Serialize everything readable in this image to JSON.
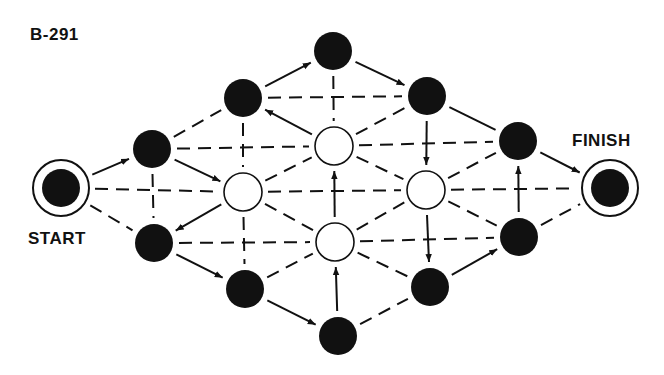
{
  "puzzle": {
    "id_label": "B-291",
    "start_label": "START",
    "finish_label": "FINISH"
  },
  "style": {
    "ink": "#111111",
    "background": "#ffffff",
    "node_radius": 19,
    "terminal_outer_radius": 28,
    "terminal_inner_radius": 19
  },
  "nodes": [
    {
      "id": "START",
      "x": 61,
      "y": 188,
      "type": "terminal"
    },
    {
      "id": "A1",
      "x": 152,
      "y": 149,
      "type": "black"
    },
    {
      "id": "A2",
      "x": 154,
      "y": 243,
      "type": "black"
    },
    {
      "id": "B1",
      "x": 243,
      "y": 98,
      "type": "black"
    },
    {
      "id": "W1",
      "x": 243,
      "y": 192,
      "type": "white"
    },
    {
      "id": "B2",
      "x": 245,
      "y": 289,
      "type": "black"
    },
    {
      "id": "T",
      "x": 333,
      "y": 51,
      "type": "black"
    },
    {
      "id": "W2",
      "x": 334,
      "y": 146,
      "type": "white"
    },
    {
      "id": "W3",
      "x": 335,
      "y": 242,
      "type": "white"
    },
    {
      "id": "Bo",
      "x": 338,
      "y": 336,
      "type": "black"
    },
    {
      "id": "C1",
      "x": 427,
      "y": 96,
      "type": "black"
    },
    {
      "id": "W4",
      "x": 426,
      "y": 190,
      "type": "white"
    },
    {
      "id": "C2",
      "x": 430,
      "y": 287,
      "type": "black"
    },
    {
      "id": "D1",
      "x": 518,
      "y": 141,
      "type": "black"
    },
    {
      "id": "D2",
      "x": 519,
      "y": 237,
      "type": "black"
    },
    {
      "id": "FINISH",
      "x": 610,
      "y": 188,
      "type": "terminal"
    }
  ],
  "edges": [
    {
      "from": "START",
      "to": "A1",
      "style": "arrow"
    },
    {
      "from": "START",
      "to": "W1",
      "style": "dashed"
    },
    {
      "from": "START",
      "to": "A2",
      "style": "dashed"
    },
    {
      "from": "A1",
      "to": "B1",
      "style": "dashed"
    },
    {
      "from": "A1",
      "to": "W2",
      "style": "dashed"
    },
    {
      "from": "A1",
      "to": "W1",
      "style": "arrow"
    },
    {
      "from": "A1",
      "to": "A2",
      "style": "dashed"
    },
    {
      "from": "W1",
      "to": "A2",
      "style": "arrow"
    },
    {
      "from": "A2",
      "to": "W3",
      "style": "dashed"
    },
    {
      "from": "A2",
      "to": "B2",
      "style": "arrow"
    },
    {
      "from": "B1",
      "to": "T",
      "style": "arrow"
    },
    {
      "from": "B1",
      "to": "C1",
      "style": "dashed"
    },
    {
      "from": "B1",
      "to": "W1",
      "style": "dashed"
    },
    {
      "from": "W2",
      "to": "B1",
      "style": "arrow"
    },
    {
      "from": "W1",
      "to": "W2",
      "style": "dashed"
    },
    {
      "from": "W1",
      "to": "W4",
      "style": "dashed"
    },
    {
      "from": "W1",
      "to": "W3",
      "style": "dashed"
    },
    {
      "from": "W1",
      "to": "B2",
      "style": "dashed"
    },
    {
      "from": "B2",
      "to": "W3",
      "style": "dashed"
    },
    {
      "from": "B2",
      "to": "Bo",
      "style": "arrow"
    },
    {
      "from": "T",
      "to": "W2",
      "style": "dashed"
    },
    {
      "from": "T",
      "to": "C1",
      "style": "arrow"
    },
    {
      "from": "W2",
      "to": "C1",
      "style": "dashed"
    },
    {
      "from": "W2",
      "to": "W4",
      "style": "dashed"
    },
    {
      "from": "W2",
      "to": "D1",
      "style": "dashed"
    },
    {
      "from": "W3",
      "to": "W2",
      "style": "arrow"
    },
    {
      "from": "W3",
      "to": "W4",
      "style": "dashed"
    },
    {
      "from": "W3",
      "to": "C2",
      "style": "dashed"
    },
    {
      "from": "W3",
      "to": "D2",
      "style": "dashed"
    },
    {
      "from": "Bo",
      "to": "W3",
      "style": "arrow"
    },
    {
      "from": "Bo",
      "to": "C2",
      "style": "dashed"
    },
    {
      "from": "C1",
      "to": "W4",
      "style": "arrow"
    },
    {
      "from": "C1",
      "to": "D1",
      "style": "solid"
    },
    {
      "from": "W4",
      "to": "D1",
      "style": "dashed"
    },
    {
      "from": "W4",
      "to": "FINISH",
      "style": "dashed"
    },
    {
      "from": "W4",
      "to": "D2",
      "style": "dashed"
    },
    {
      "from": "W4",
      "to": "C2",
      "style": "arrow"
    },
    {
      "from": "C2",
      "to": "D2",
      "style": "arrow"
    },
    {
      "from": "D2",
      "to": "D1",
      "style": "arrow"
    },
    {
      "from": "D1",
      "to": "FINISH",
      "style": "arrow"
    },
    {
      "from": "D2",
      "to": "FINISH",
      "style": "dashed"
    }
  ]
}
